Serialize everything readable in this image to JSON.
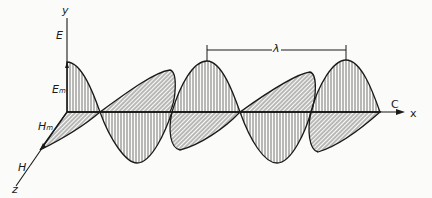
{
  "diagram": {
    "labels": {
      "y_axis": "y",
      "x_axis": "x",
      "z_axis": "z",
      "electric_field": "E",
      "electric_amplitude": "E",
      "electric_amplitude_sub": "m",
      "magnetic_amplitude": "H",
      "magnetic_amplitude_sub": "m",
      "magnetic_field": "H",
      "velocity": "C",
      "wavelength": "λ"
    },
    "colors": {
      "ink": "#1a1a1a",
      "background": "#fbfbfa"
    },
    "components": [
      {
        "name": "electric-field-wave",
        "plane": "xy",
        "hatch": "vertical"
      },
      {
        "name": "magnetic-field-wave",
        "plane": "xz",
        "hatch": "diagonal"
      }
    ],
    "wavelength_markers": {
      "start_peak": 2,
      "end_peak": 3
    }
  }
}
